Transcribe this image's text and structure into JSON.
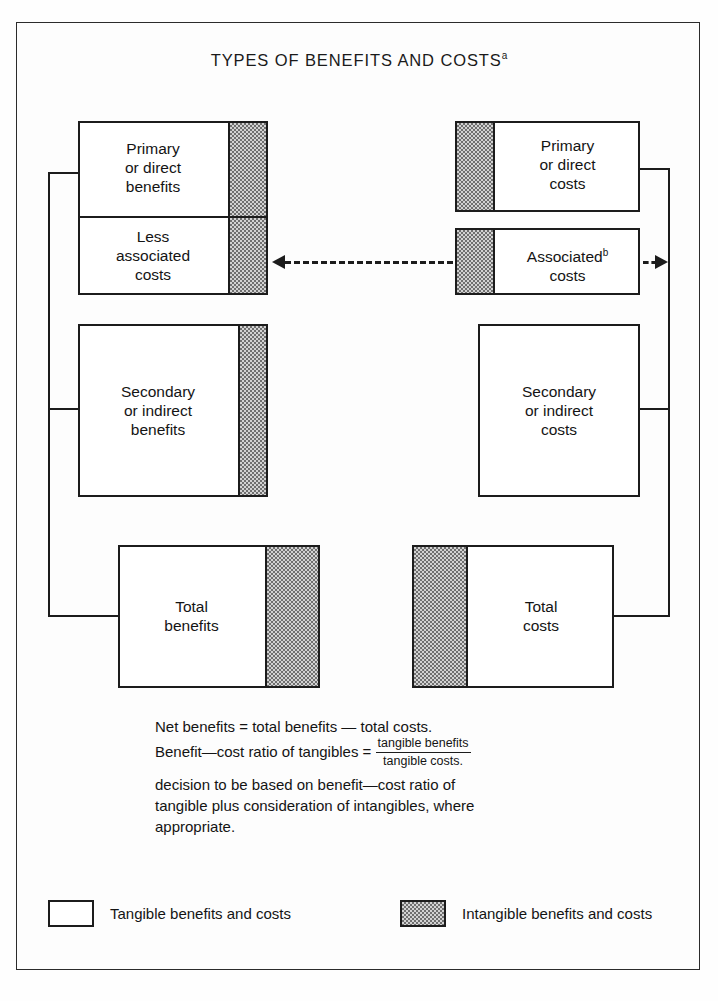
{
  "figure": {
    "title": "TYPES OF BENEFITS AND COSTS",
    "title_superscript": "a"
  },
  "boxes": {
    "primary_benefits": {
      "line1": "Primary",
      "line2": "or direct",
      "line3": "benefits"
    },
    "less_associated_costs": {
      "line1": "Less",
      "line2": "associated",
      "line3": "costs"
    },
    "secondary_benefits": {
      "line1": "Secondary",
      "line2": "or indirect",
      "line3": "benefits"
    },
    "total_benefits": {
      "line1": "Total",
      "line2": "benefits"
    },
    "primary_costs": {
      "line1": "Primary",
      "line2": "or direct",
      "line3": "costs"
    },
    "associated_costs": {
      "line1": "Associated",
      "superscript": "b",
      "line2": "costs"
    },
    "secondary_costs": {
      "line1": "Secondary",
      "line2": "or indirect",
      "line3": "costs"
    },
    "total_costs": {
      "line1": "Total",
      "line2": "costs"
    }
  },
  "notes": {
    "line1": "Net benefits = total benefits — total costs.",
    "line2_prefix": "Benefit—cost ratio of tangibles = ",
    "fraction_numerator": "tangible benefits",
    "fraction_denominator": "tangible costs.",
    "line3": "decision to be based on benefit—cost ratio of",
    "line4": "tangible plus consideration of intangibles, where",
    "line5": "appropriate."
  },
  "legend": {
    "tangible_label": "Tangible benefits and costs",
    "intangible_label": "Intangible benefits and costs"
  },
  "colors": {
    "line": "#1c1c1c",
    "intangible_fill": "#d2d2d2",
    "intangible_dots": "#6f6f6f",
    "tangible_fill": "#ffffff",
    "background": "#fdfdfd"
  }
}
